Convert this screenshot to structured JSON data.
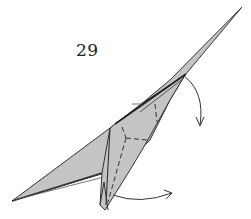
{
  "diagram": {
    "step_number": "29",
    "paper_color": "#c4c4c4",
    "line_color": "#333333",
    "elements": [
      {
        "type": "folded-model",
        "description": "origami model with long pointed tip toward upper right and wing toward lower left"
      },
      {
        "type": "valley-fold-line",
        "description": "dashed fold lines forming a Y shape on the central flap"
      },
      {
        "type": "arrow",
        "description": "curved arrow at upper right pointing down (fold down)"
      },
      {
        "type": "arrow",
        "description": "curved arrow at bottom pointing right (swing flap over)"
      }
    ]
  }
}
